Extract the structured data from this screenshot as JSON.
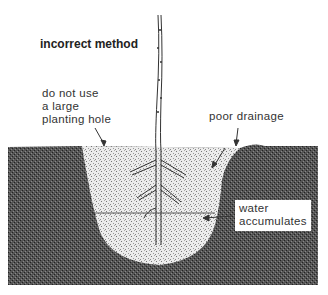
{
  "diagram": {
    "title": "incorrect method",
    "labels": {
      "large_hole": [
        "do not use",
        "a large",
        "planting hole"
      ],
      "poor_drainage": "poor drainage",
      "water_accumulates": [
        "water",
        "accumulates"
      ]
    },
    "colors": {
      "background": "#ffffff",
      "native_soil": "#4a4a4a",
      "backfill": "#e4e4e4",
      "line": "#333333"
    }
  }
}
